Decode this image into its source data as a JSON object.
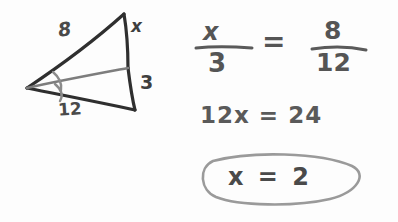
{
  "canvas": {
    "width": 398,
    "height": 222,
    "background": "#fdfdfd"
  },
  "ink": {
    "dark": "#2f2f2f",
    "medium": "#4a4a4a",
    "gray": "#8b8b8b",
    "light_gray": "#9a9a9a"
  },
  "figure": {
    "name": "triangle-with-angle-bisector",
    "labels": {
      "upper_side": "8",
      "right_upper_side": "x",
      "right_lower_side": "3",
      "lower_side": "12"
    },
    "angle_marks": 2
  },
  "work": {
    "proportion": {
      "left_numerator": "x",
      "left_denominator": "3",
      "equals": "=",
      "right_numerator": "8",
      "right_denominator": "12"
    },
    "step_two": "12x = 24",
    "answer": "x = 2"
  }
}
